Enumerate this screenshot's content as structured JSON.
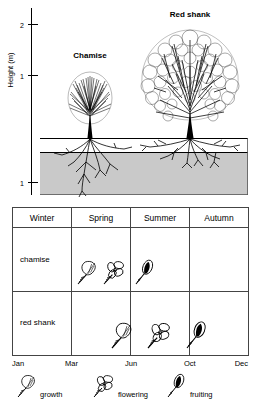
{
  "figure": {
    "panels": [
      "shrub-profile-diagram",
      "phenology-table"
    ]
  },
  "profile": {
    "y_axis": {
      "label": "Height (m)",
      "ticks": [
        {
          "value": "2",
          "position": "above-ground"
        },
        {
          "value": "1",
          "position": "above-ground"
        },
        {
          "value": "1",
          "position": "below-ground"
        }
      ]
    },
    "plants": [
      {
        "name": "Chamise",
        "habit": "narrow dense upright shrub",
        "canopy_height_m": 1.0,
        "root_depth_m": 1.0
      },
      {
        "name": "Red shank",
        "habit": "tall broad cloud-canopy shrub",
        "canopy_height_m": 2.0,
        "root_depth_m": 0.4
      }
    ],
    "ground": {
      "surface_band": "white shallow layer",
      "soil_fill": "#c9c9c9"
    }
  },
  "table": {
    "columns": [
      "Winter",
      "Spring",
      "Summer",
      "Autumn"
    ],
    "rows": [
      {
        "label": "chamise",
        "events": [
          {
            "type": "growth",
            "month": "Apr"
          },
          {
            "type": "flowering",
            "month": "May"
          },
          {
            "type": "fruiting",
            "month": "Jul"
          }
        ]
      },
      {
        "label": "red shank",
        "events": [
          {
            "type": "growth",
            "month": "Jun"
          },
          {
            "type": "flowering",
            "month": "Aug"
          },
          {
            "type": "fruiting",
            "month": "Oct"
          }
        ]
      }
    ],
    "month_axis": [
      "Jan",
      "Mar",
      "Jun",
      "Oct",
      "Dec"
    ]
  },
  "legend": {
    "items": [
      {
        "icon": "leaf-icon",
        "label": "growth"
      },
      {
        "icon": "flower-icon",
        "label": "flowering"
      },
      {
        "icon": "fruit-icon",
        "label": "fruiting"
      }
    ]
  },
  "colors": {
    "ink": "#000000",
    "soil": "#c9c9c9",
    "rule": "#555555",
    "background": "#ffffff"
  }
}
